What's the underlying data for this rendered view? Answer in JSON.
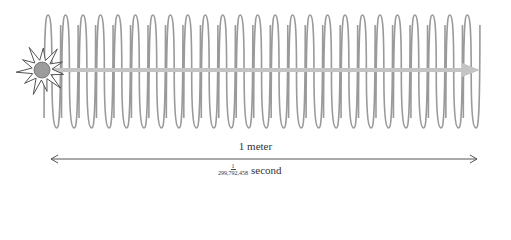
{
  "diagram": {
    "coil": {
      "color": "#9a9a9a",
      "loops": 25,
      "x_start": 48,
      "x_end": 476,
      "y_top": 15,
      "y_bottom": 128
    },
    "beam": {
      "color": "#c4c4c4",
      "y": 70,
      "x_start": 50,
      "x_end": 478
    },
    "source": {
      "type": "starburst-light-source",
      "ball_color": "#9c9c9c",
      "cx": 42,
      "cy": 70
    },
    "measure": {
      "label_top": "1 meter",
      "fraction_numerator": "1",
      "fraction_denominator": "299,792,458",
      "label_bottom_unit": "second",
      "x_start": 50,
      "x_end": 478,
      "y": 159,
      "color": "#555555"
    }
  }
}
